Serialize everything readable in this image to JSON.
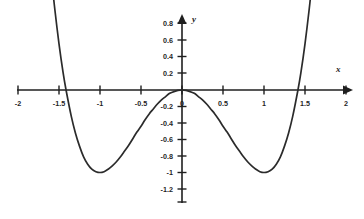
{
  "chart_data": {
    "type": "line",
    "title": "",
    "subtitle": "",
    "xlabel": "x",
    "ylabel": "y",
    "xlim": [
      -2,
      2
    ],
    "ylim": [
      -1.2,
      0.8
    ],
    "grid": false,
    "legend": null,
    "legend_position": "none",
    "x_ticks": [
      -2,
      -1.5,
      -1,
      -0.5,
      0,
      0.5,
      1,
      1.5,
      2
    ],
    "x_tick_labels": [
      "-2",
      "-1.5",
      "-1",
      "-0.5",
      "0",
      "0.5",
      "1",
      "1.5",
      "2"
    ],
    "y_ticks": [
      0.8,
      0.6,
      0.4,
      0.2,
      0,
      -0.2,
      -0.4,
      -0.6,
      -0.8,
      -1,
      -1.2
    ],
    "y_tick_labels": [
      "0.8",
      "0.6",
      "0.4",
      "0.2",
      "0",
      "-0.2",
      "-0.4",
      "-0.6",
      "-0.8",
      "-1",
      "-1.2"
    ],
    "series": [
      {
        "name": "y = x^4 - 2x^2",
        "color": "#2b2b2b",
        "x": [
          -1.585,
          -1.55,
          -1.5,
          -1.45,
          -1.414,
          -1.35,
          -1.3,
          -1.25,
          -1.2,
          -1.15,
          -1.1,
          -1.05,
          -1.0,
          -0.95,
          -0.9,
          -0.85,
          -0.8,
          -0.75,
          -0.7,
          -0.65,
          -0.6,
          -0.55,
          -0.5,
          -0.45,
          -0.4,
          -0.35,
          -0.3,
          -0.25,
          -0.2,
          -0.15,
          -0.1,
          -0.05,
          0.0,
          0.05,
          0.1,
          0.15,
          0.2,
          0.25,
          0.3,
          0.35,
          0.4,
          0.45,
          0.5,
          0.55,
          0.6,
          0.65,
          0.7,
          0.75,
          0.8,
          0.85,
          0.9,
          0.95,
          1.0,
          1.05,
          1.1,
          1.15,
          1.2,
          1.25,
          1.3,
          1.35,
          1.414,
          1.45,
          1.5,
          1.55,
          1.585
        ],
        "y": [
          1.29,
          0.97,
          0.56,
          0.21,
          0.0,
          -0.32,
          -0.52,
          -0.68,
          -0.81,
          -0.9,
          -0.96,
          -0.99,
          -1.0,
          -0.99,
          -0.96,
          -0.92,
          -0.87,
          -0.81,
          -0.74,
          -0.67,
          -0.59,
          -0.51,
          -0.44,
          -0.36,
          -0.29,
          -0.23,
          -0.17,
          -0.12,
          -0.08,
          -0.04,
          -0.02,
          -0.005,
          0.0,
          -0.005,
          -0.02,
          -0.04,
          -0.08,
          -0.12,
          -0.17,
          -0.23,
          -0.29,
          -0.36,
          -0.44,
          -0.51,
          -0.59,
          -0.67,
          -0.74,
          -0.81,
          -0.87,
          -0.92,
          -0.96,
          -0.99,
          -1.0,
          -0.99,
          -0.96,
          -0.9,
          -0.81,
          -0.68,
          -0.52,
          -0.32,
          0.0,
          0.21,
          0.56,
          0.97,
          1.29
        ]
      }
    ],
    "annotations": [],
    "key_points": {
      "local_maximum": [
        0,
        0
      ],
      "minima": [
        [
          -1,
          -1
        ],
        [
          1,
          -1
        ]
      ],
      "x_intercepts": [
        -1.414,
        0,
        1.414
      ]
    },
    "axis_arrows": {
      "x_positive": true,
      "y_positive": true
    }
  }
}
